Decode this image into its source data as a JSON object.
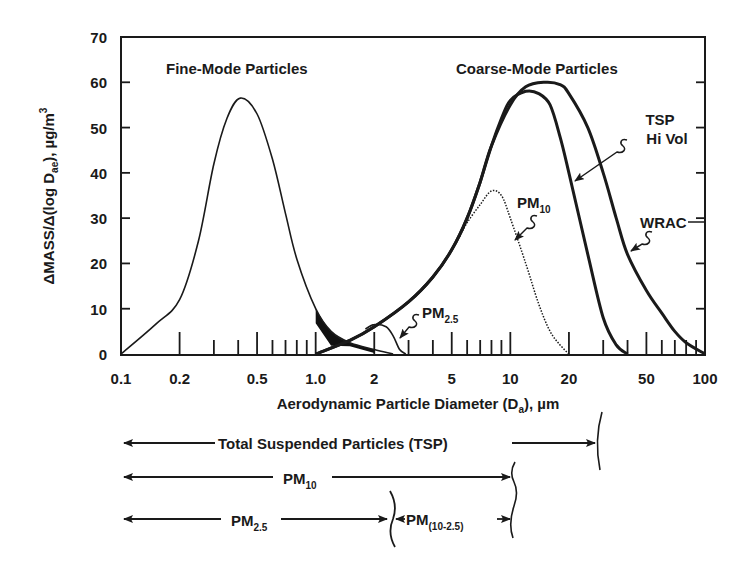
{
  "chart_data": {
    "type": "line",
    "title": "",
    "xlabel": "Aerodynamic Particle Diameter (Da), µm",
    "xlabel_main": "Aerodynamic Particle Diameter (D",
    "xlabel_sub": "a",
    "xlabel_tail": "), µm",
    "ylabel": "ΔMASS/Δ(log Dae), µg/m3",
    "ylabel_main": "ΔMASS/Δ(log D",
    "ylabel_sub": "ae",
    "ylabel_tail": "), µg/m",
    "ylabel_sup": "3",
    "xscale": "log",
    "xlim": [
      0.1,
      100
    ],
    "ylim": [
      0,
      70
    ],
    "x_ticks": [
      {
        "value": 0.1,
        "label": "0.1"
      },
      {
        "value": 0.2,
        "label": "0.2"
      },
      {
        "value": 0.5,
        "label": "0.5"
      },
      {
        "value": 1.0,
        "label": "1.0"
      },
      {
        "value": 2,
        "label": "2"
      },
      {
        "value": 5,
        "label": "5"
      },
      {
        "value": 10,
        "label": "10"
      },
      {
        "value": 20,
        "label": "20"
      },
      {
        "value": 50,
        "label": "50"
      },
      {
        "value": 100,
        "label": "100"
      }
    ],
    "y_ticks": [
      0,
      10,
      20,
      30,
      40,
      50,
      60,
      70
    ],
    "grid": false,
    "legend": "none (curves labeled by inline annotations)",
    "annotations": [
      {
        "text": "Fine-Mode Particles"
      },
      {
        "text": "Coarse-Mode Particles"
      },
      {
        "text": "TSP Hi Vol"
      },
      {
        "text": "WRAC"
      },
      {
        "text": "PM10"
      },
      {
        "text": "PM2.5"
      }
    ],
    "series": [
      {
        "name": "Fine-Mode Particles",
        "style": "solid-thin",
        "x": [
          0.1,
          0.15,
          0.2,
          0.25,
          0.3,
          0.35,
          0.41,
          0.5,
          0.6,
          0.7,
          0.8,
          1.0,
          1.2,
          1.5,
          2.0,
          2.5
        ],
        "y": [
          0,
          6.5,
          12,
          25,
          42,
          52,
          56.5,
          53,
          43,
          31,
          21,
          10,
          5,
          2.5,
          1,
          0
        ]
      },
      {
        "name": "Coarse-Mode (WRAC)",
        "style": "solid-thick",
        "x": [
          1.0,
          1.5,
          2,
          3,
          4,
          5,
          6,
          7,
          8,
          10,
          12,
          15,
          18,
          20,
          25,
          30,
          35,
          40,
          50,
          60,
          70,
          80,
          100
        ],
        "y": [
          0,
          3,
          6,
          11.5,
          17,
          23,
          30,
          38,
          46,
          55,
          59,
          60,
          59.5,
          57.5,
          50,
          40,
          30,
          22,
          14,
          9,
          5,
          2.5,
          0
        ]
      },
      {
        "name": "TSP Hi Vol",
        "style": "solid-thick",
        "x": [
          1.0,
          1.5,
          2,
          3,
          4,
          5,
          6,
          7,
          8,
          9,
          10,
          12,
          14,
          16,
          18,
          20,
          25,
          30,
          35,
          40
        ],
        "y": [
          0,
          3,
          6,
          11.5,
          17,
          23,
          30,
          38,
          46,
          52,
          56,
          58,
          57.5,
          55,
          48,
          40,
          22,
          8,
          2,
          0
        ]
      },
      {
        "name": "PM10",
        "style": "dotted",
        "x": [
          5.5,
          6,
          7,
          8,
          9,
          10,
          12,
          14,
          16,
          18,
          20
        ],
        "y": [
          26,
          29,
          33,
          36,
          35,
          30,
          20,
          11,
          5,
          2,
          0
        ]
      },
      {
        "name": "PM2.5",
        "style": "solid-thin",
        "x": [
          1.8,
          2.0,
          2.3,
          2.5,
          2.7,
          2.9
        ],
        "y": [
          5.5,
          6.5,
          6.0,
          4.0,
          1.0,
          0
        ]
      }
    ],
    "size_ranges": [
      {
        "label": "Total Suspended Particles (TSP)",
        "from": 0.1,
        "to": 30
      },
      {
        "label": "PM10",
        "from": 0.1,
        "to": 10
      },
      {
        "label": "PM2.5",
        "from": 0.1,
        "to": 2.5
      },
      {
        "label": "PM(10-2.5)",
        "from": 2.5,
        "to": 10
      }
    ]
  },
  "labels": {
    "fine_mode": "Fine-Mode Particles",
    "coarse_mode": "Coarse-Mode Particles",
    "tsp_line1": "TSP",
    "tsp_line2": "Hi Vol",
    "wrac": "WRAC",
    "pm10_main": "PM",
    "pm10_sub": "10",
    "pm25_main": "PM",
    "pm25_sub": "2.5",
    "range_tsp": "Total Suspended Particles (TSP)",
    "range_pm10_main": "PM",
    "range_pm10_sub": "10",
    "range_pm25_main": "PM",
    "range_pm25_sub": "2.5",
    "range_coarse_main": "PM",
    "range_coarse_sub": "(10-2.5)"
  },
  "colors": {
    "ink": "#1a1a1a",
    "background": "#ffffff"
  }
}
